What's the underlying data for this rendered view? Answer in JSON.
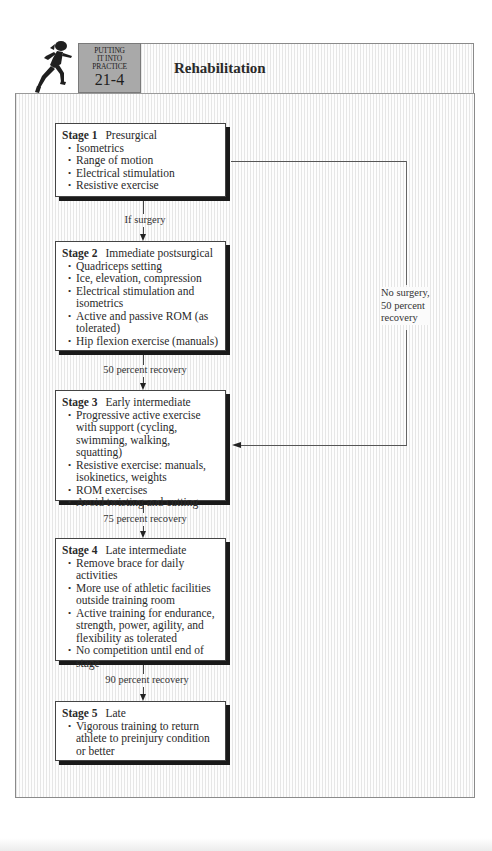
{
  "header": {
    "badge": {
      "line1": "PUTTING",
      "line2": "IT INTO",
      "line3": "PRACTICE",
      "number": "21-4"
    },
    "title": "Rehabilitation",
    "icon": "runner-icon"
  },
  "stages": [
    {
      "label": "Stage 1",
      "name": "Presurgical",
      "items": [
        "Isometrics",
        "Range of motion",
        "Electrical stimulation",
        "Resistive exercise"
      ]
    },
    {
      "label": "Stage 2",
      "name": "Immediate postsurgical",
      "items": [
        "Quadriceps setting",
        "Ice, elevation, compression",
        "Electrical stimulation and isometrics",
        "Active and passive ROM (as tolerated)",
        "Hip flexion exercise (manuals)"
      ]
    },
    {
      "label": "Stage 3",
      "name": "Early intermediate",
      "items": [
        "Progressive active exercise with support (cycling, swimming, walking, squatting)",
        "Resistive exercise: manuals, isokinetics, weights",
        "ROM exercises",
        "Avoid twisting and cutting"
      ]
    },
    {
      "label": "Stage 4",
      "name": "Late intermediate",
      "items": [
        "Remove brace for daily activities",
        "More use of athletic facilities outside training room",
        "Active training for endurance, strength, power, agility, and flexibility as tolerated",
        "No competition until end of stage"
      ]
    },
    {
      "label": "Stage 5",
      "name": "Late",
      "items": [
        "Vigorous training to return athlete to preinjury condition or better"
      ]
    }
  ],
  "connectors": [
    {
      "from": "Stage 1",
      "to": "Stage 2",
      "label": "If surgery"
    },
    {
      "from": "Stage 2",
      "to": "Stage 3",
      "label": "50 percent recovery"
    },
    {
      "from": "Stage 3",
      "to": "Stage 4",
      "label": "75 percent recovery"
    },
    {
      "from": "Stage 4",
      "to": "Stage 5",
      "label": "90 percent recovery"
    },
    {
      "from": "Stage 1",
      "to": "Stage 3",
      "label": "No surgery, 50 percent recovery"
    }
  ],
  "side_label": {
    "line1": "No surgery,",
    "line2": "50 percent",
    "line3": "recovery"
  },
  "colors": {
    "badge_bg": "#a9a9a9",
    "box_shadow": "#1a1a1a",
    "stripe": "#e6e6e6"
  }
}
